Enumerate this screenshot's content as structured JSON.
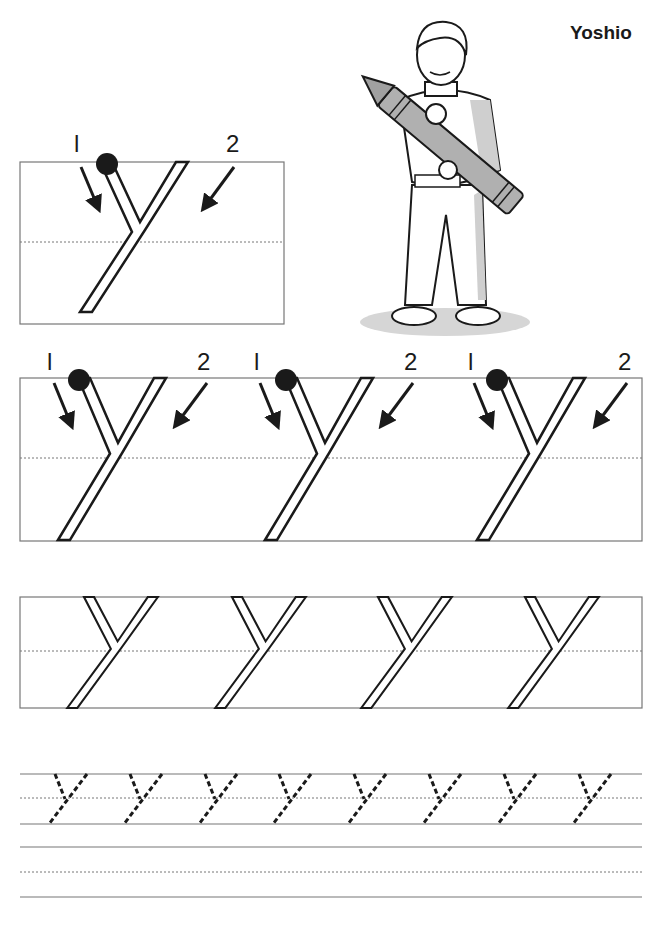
{
  "worksheet": {
    "title": "Yoshio",
    "letter": "y",
    "illustration": "boy-holding-giant-crayon",
    "stroke_labels": [
      "1",
      "2"
    ],
    "sections": [
      {
        "name": "model-letter-box",
        "count": 1,
        "style": "outlined-with-stroke-order"
      },
      {
        "name": "stroke-order-row",
        "count": 3,
        "style": "outlined-with-stroke-order"
      },
      {
        "name": "outlined-tracing-row",
        "count": 4,
        "style": "outlined"
      },
      {
        "name": "dashed-tracing-row",
        "count": 8,
        "style": "dashed"
      },
      {
        "name": "blank-practice-row",
        "count": 0,
        "style": "blank"
      }
    ],
    "colors": {
      "line": "#777777",
      "ink": "#1a1a1a",
      "shade": "#c8c8c8"
    }
  }
}
